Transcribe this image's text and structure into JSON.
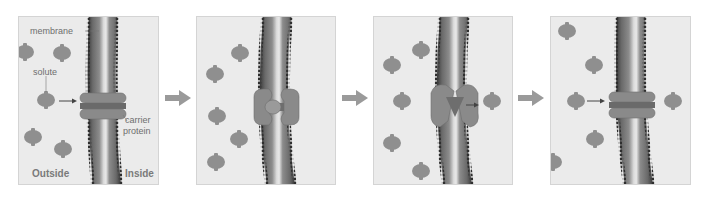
{
  "diagram": {
    "colors": {
      "background": "#ffffff",
      "panel_fill": "#ebebeb",
      "panel_border": "#d4d4d4",
      "membrane_dark": "#3f3f3f",
      "membrane_mid": "#7a7a7a",
      "membrane_light": "#d9d9d9",
      "solute": "#8f8f8f",
      "protein": "#8a8a8a",
      "arrow": "#9a9a9a",
      "label_text": "#6e6e6e"
    },
    "labels": {
      "membrane": "membrane",
      "solute": "solute",
      "carrier_protein_line1": "carrier",
      "carrier_protein_line2": "protein",
      "outside": "Outside",
      "inside": "Inside"
    },
    "panels": [
      {
        "step": 1,
        "description": "Solute approaches carrier protein from outside",
        "protein_state": "closed"
      },
      {
        "step": 2,
        "description": "Solute binds to carrier protein",
        "protein_state": "bound"
      },
      {
        "step": 3,
        "description": "Carrier protein changes shape, releases solute inside",
        "protein_state": "open-inside"
      },
      {
        "step": 4,
        "description": "Carrier protein returns to original shape",
        "protein_state": "closed"
      }
    ],
    "step_arrows": 3
  }
}
